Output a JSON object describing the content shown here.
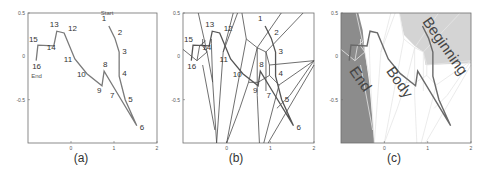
{
  "figure": {
    "panels": [
      {
        "id": "a",
        "caption": "(a)"
      },
      {
        "id": "b",
        "caption": "(b)"
      },
      {
        "id": "c",
        "caption": "(c)"
      }
    ],
    "axes": {
      "x_ticks": [
        "0",
        "1",
        "2"
      ],
      "y_ticks": [
        "0.5",
        "0",
        "-0.5"
      ],
      "xlim": [
        -1,
        2
      ],
      "ylim": [
        -1,
        0.5
      ]
    },
    "labels": {
      "start": "Start",
      "end": "End",
      "regions": [
        "End",
        "Body",
        "Beginning"
      ]
    },
    "trajectory": [
      {
        "n": "1",
        "x": 0.88,
        "y": 0.35
      },
      {
        "n": "2",
        "x": 1.02,
        "y": 0.21
      },
      {
        "n": "3",
        "x": 1.12,
        "y": 0.05
      },
      {
        "n": "4",
        "x": 1.12,
        "y": -0.23
      },
      {
        "n": "5",
        "x": 1.26,
        "y": -0.5
      },
      {
        "n": "6",
        "x": 1.53,
        "y": -0.8
      },
      {
        "n": "7",
        "x": 1.07,
        "y": -0.42
      },
      {
        "n": "8",
        "x": 0.77,
        "y": -0.17
      },
      {
        "n": "9",
        "x": 0.72,
        "y": -0.34
      },
      {
        "n": "10",
        "x": 0.37,
        "y": -0.2
      },
      {
        "n": "11",
        "x": 0.09,
        "y": -0.03
      },
      {
        "n": "12",
        "x": -0.16,
        "y": 0.27
      },
      {
        "n": "13",
        "x": -0.33,
        "y": 0.29
      },
      {
        "n": "14",
        "x": -0.4,
        "y": 0.12
      },
      {
        "n": "15",
        "x": -0.77,
        "y": 0.13
      },
      {
        "n": "16",
        "x": -0.81,
        "y": -0.05
      }
    ],
    "colors": {
      "frame": "#6e6e6e",
      "trajectory": "#7a7a7a",
      "voronoi": "#4a4a4a",
      "end_region": "#8c8c8c",
      "beginning_region": "#d4d4d4",
      "body_region": "#ffffff",
      "text": "#333333"
    }
  }
}
